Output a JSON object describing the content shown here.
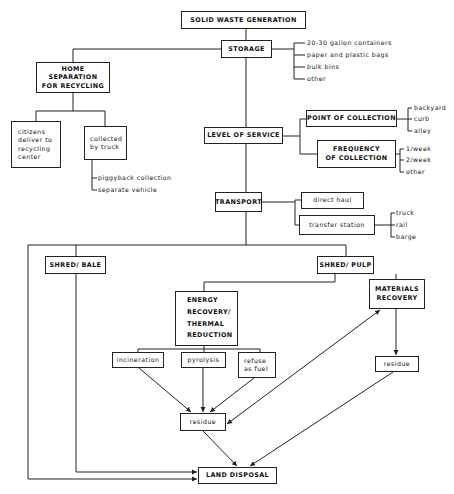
{
  "diagram": {
    "nodes": {
      "generation": "SOLID WASTE GENERATION",
      "storage": "STORAGE",
      "home_separation": "HOME SEPARATION\nFOR RECYCLING",
      "citizens_deliver": "citizens\ndeliver to\nrecycling\ncenter",
      "collected_by_truck": "collected\nby truck",
      "level_of_service": "LEVEL OF SERVICE",
      "point_of_collection": "POINT OF COLLECTION",
      "frequency_of_collection": "FREQUENCY\nOF COLLECTION",
      "transport": "TRANSPORT",
      "direct_haul": "direct haul",
      "transfer_station": "transfer station",
      "shred_bale": "SHRED/ BALE",
      "shred_pulp": "SHRED/ PULP",
      "energy_recovery": "ENERGY\nRECOVERY/\nTHERMAL\nREDUCTION",
      "materials_recovery": "MATERIALS\nRECOVERY",
      "incineration": "incineration",
      "pyrolysis": "pyrolysis",
      "refuse_as_fuel": "refuse\nas fuel",
      "residue_center": "residue",
      "residue_right": "residue",
      "land_disposal": "LAND DISPOSAL"
    },
    "storage_options": [
      "20-30 gallon containers",
      "paper and plastic bags",
      "bulk bins",
      "other"
    ],
    "truck_options": [
      "piggyback collection",
      "separate vehicle"
    ],
    "point_options": [
      "backyard",
      "curb",
      "alley"
    ],
    "frequency_options": [
      "1/week",
      "2/week",
      "other"
    ],
    "transfer_options": [
      "truck",
      "rail",
      "barge"
    ]
  }
}
